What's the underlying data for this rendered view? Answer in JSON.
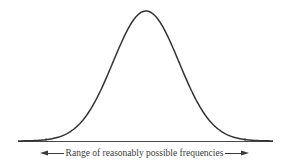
{
  "chart_data": {
    "type": "line",
    "title": "",
    "distribution": "normal",
    "xlabel": "",
    "ylabel": "",
    "grid": false,
    "legend": null,
    "axis_ticks": {
      "x": [],
      "y": []
    },
    "range_marks": {
      "left_tick": "lower bound",
      "right_tick": "upper bound"
    },
    "annotation": "Range of reasonably possible frequencies",
    "geometry_px": {
      "baseline_y": 141,
      "baseline_x_start": 18,
      "baseline_x_end": 273,
      "peak_x": 146,
      "peak_y": 11,
      "sigma": 33,
      "tick_left_x": 46,
      "tick_right_x": 245
    }
  },
  "figure": {
    "caption": "Range of reasonably possible frequencies",
    "stroke_color": "#3a3a3a",
    "background": "#ffffff"
  }
}
